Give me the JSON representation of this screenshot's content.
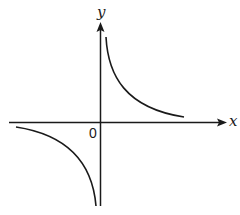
{
  "diagram": {
    "type": "function-graph",
    "axes": {
      "x_label": "x",
      "y_label": "y",
      "origin_label": "0"
    },
    "curve": {
      "equation_form": "y = k/x",
      "branches": [
        "quadrant-1",
        "quadrant-3"
      ],
      "asymptotes": [
        "x-axis",
        "y-axis"
      ]
    },
    "colors": {
      "stroke": "#1a1a1a",
      "background": "#ffffff"
    }
  }
}
